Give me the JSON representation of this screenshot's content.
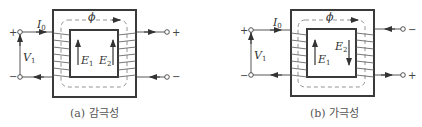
{
  "diagrams": [
    {
      "id": "a",
      "caption": "(a) 감극성",
      "labels": {
        "current": "I",
        "current_sub": "0",
        "flux": "ϕ",
        "voltage": "V",
        "voltage_sub": "1",
        "emf1": "E",
        "emf1_sub": "1",
        "emf2": "E",
        "emf2_sub": "2",
        "left_top_polarity": "+",
        "left_bottom_polarity": "−",
        "right_top_polarity": "+",
        "right_bottom_polarity": "−"
      },
      "emf2_direction": "up"
    },
    {
      "id": "b",
      "caption": "(b) 가극성",
      "labels": {
        "current": "I",
        "current_sub": "0",
        "flux": "ϕ",
        "voltage": "V",
        "voltage_sub": "1",
        "emf1": "E",
        "emf1_sub": "1",
        "emf2": "E",
        "emf2_sub": "2",
        "left_top_polarity": "+",
        "left_bottom_polarity": "−",
        "right_top_polarity": "−",
        "right_bottom_polarity": "+"
      },
      "emf2_direction": "down"
    }
  ],
  "colors": {
    "core": "#3a3a3a",
    "wire": "#555555",
    "flux": "#777777",
    "text": "#333333"
  }
}
